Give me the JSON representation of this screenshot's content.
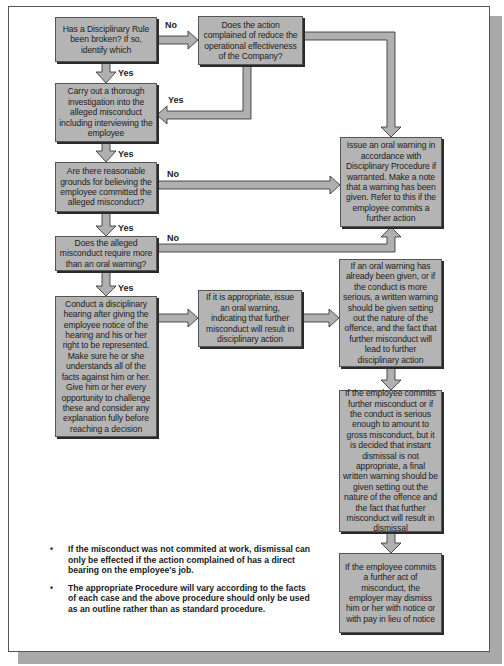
{
  "flowchart": {
    "boxes": {
      "rule_broken": "Has a Disciplinary Rule been broken? If so, identify which",
      "reduce_effectiveness": "Does the action complained of reduce the operational effectiveness of the Company?",
      "investigate": "Carry out a thorough investigation into the alleged misconduct including interviewing the employee",
      "reasonable_grounds": "Are there reasonable grounds for believing the employee committed the alleged misconduct?",
      "require_more": "Does the alleged misconduct require more than an oral warning?",
      "hearing": "Conduct a disciplinary hearing after giving the employee notice of the hearing and his or her right to be represented. Make sure he or she understands all of the facts against him or her. Give him or her every opportunity to challenge these and consider any explanation fully before reaching a decision",
      "issue_oral_if_appropriate": "If it is appropriate, issue an oral warning, indicating that further misconduct will result in disciplinary action",
      "oral_warning": "Issue an oral warning in accordance with Disciplinary Procedure if warranted. Make a note that a warning has been given. Refer to this if the employee commits a further action",
      "written_warning": "If an oral warning has already been given, or if the conduct is more serious, a written warning should be given setting out the nature of the offence, and the fact that further misconduct will lead to further disciplinary action",
      "final_warning": "If the employee commits further misconduct or if the conduct is serious enough to amount to gross misconduct, but it is decided that instant dismissal is not appropriate, a final written warning should be given setting out the nature of the offence and the fact that further misconduct will result in dismissal",
      "dismissal": "If the employee commits a further act of misconduct, the employer may dismiss him or her with notice or with pay in lieu of notice"
    },
    "labels": {
      "no_1": "No",
      "yes_1": "Yes",
      "yes_2": "Yes",
      "yes_3": "Yes",
      "no_2": "No",
      "yes_4": "Yes",
      "no_3": "No",
      "yes_5": "Yes"
    },
    "colors": {
      "box_fill": "#b4b4b4",
      "arrow_fill": "#b0b0b0",
      "arrow_edge": "#2a2a2a",
      "page_shadow": "#a9a9a9"
    }
  },
  "notes": {
    "bullet": "•",
    "items": [
      "If the misconduct was not commited at work, dismissal can only be effected if the action complained of has a direct bearing on the employee's job.",
      "The appropriate Procedure will vary according to the facts of each case and the above procedure should only be used as an outline rather than as standard procedure."
    ]
  }
}
